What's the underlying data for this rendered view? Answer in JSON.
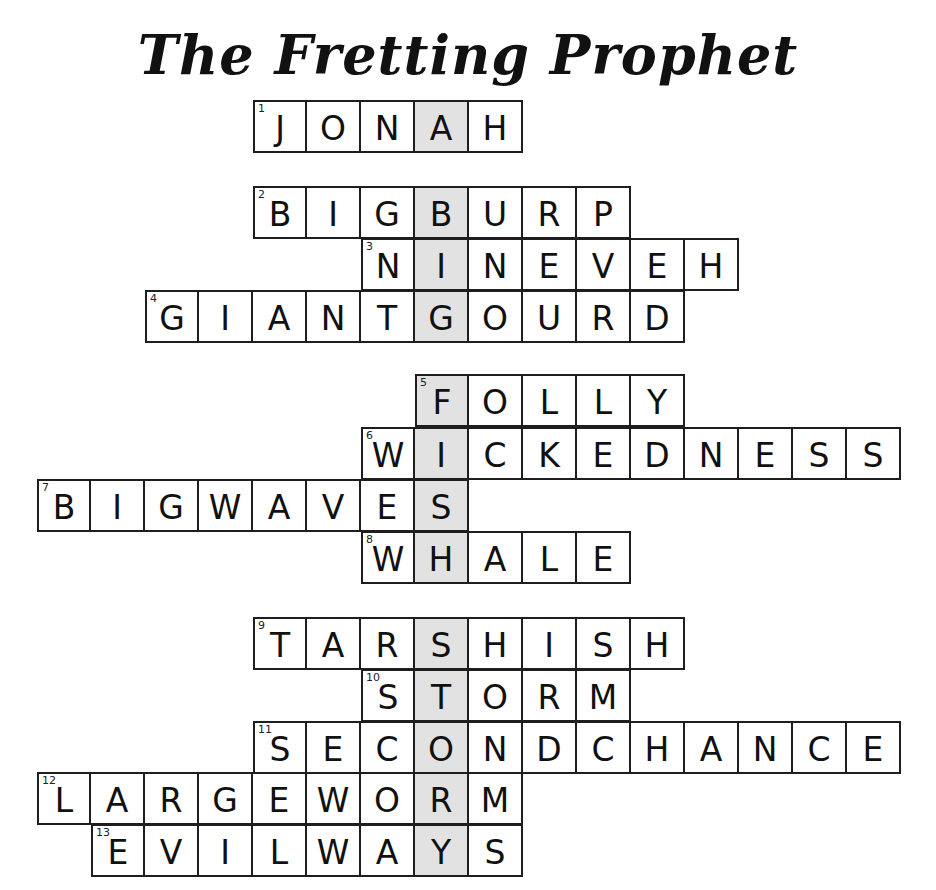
{
  "title": "The Fretting Prophet",
  "layout": {
    "col0_x": 37,
    "cell_w": 54,
    "cell_h": 53,
    "highlight_col": 7
  },
  "colors": {
    "highlight": "#e2e2e2",
    "border": "#1e1e1e",
    "text": "#111111"
  },
  "hidden_message": "A BIG FISH STORY",
  "answers": [
    {
      "number": "1",
      "word": "JONAH",
      "col": 4,
      "top": 100
    },
    {
      "number": "2",
      "word": "BIGBURP",
      "col": 4,
      "top": 186
    },
    {
      "number": "3",
      "word": "NINEVEH",
      "col": 6,
      "top": 238
    },
    {
      "number": "4",
      "word": "GIANTGOURD",
      "col": 2,
      "top": 290
    },
    {
      "number": "5",
      "word": "FOLLY",
      "col": 7,
      "top": 374
    },
    {
      "number": "6",
      "word": "WICKEDNESS",
      "col": 6,
      "top": 427
    },
    {
      "number": "7",
      "word": "BIGWAVES",
      "col": 0,
      "top": 479
    },
    {
      "number": "8",
      "word": "WHALE",
      "col": 6,
      "top": 531
    },
    {
      "number": "9",
      "word": "TARSHISH",
      "col": 4,
      "top": 617
    },
    {
      "number": "10",
      "word": "STORM",
      "col": 6,
      "top": 669
    },
    {
      "number": "11",
      "word": "SECONDCHANCE",
      "col": 4,
      "top": 721
    },
    {
      "number": "12",
      "word": "LARGEWORM",
      "col": 0,
      "top": 772
    },
    {
      "number": "13",
      "word": "EVILWAYS",
      "col": 1,
      "top": 824
    }
  ]
}
